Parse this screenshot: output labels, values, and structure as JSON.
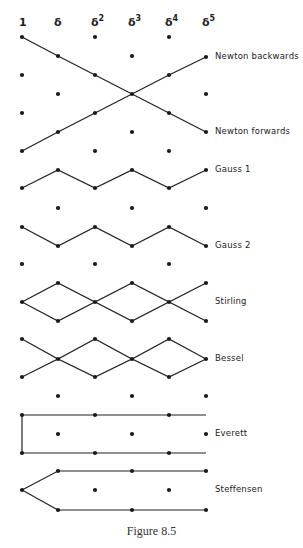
{
  "figure": {
    "caption": "Figure 8.5",
    "columns": [
      {
        "base": "1",
        "power": ""
      },
      {
        "base": "δ",
        "power": ""
      },
      {
        "base": "δ",
        "power": "2"
      },
      {
        "base": "δ",
        "power": "3"
      },
      {
        "base": "δ",
        "power": "4"
      },
      {
        "base": "δ",
        "power": "5"
      }
    ],
    "col_x": [
      22,
      58,
      95,
      132,
      169,
      206
    ],
    "line_color": "#222222",
    "dot_color": "#1a1a1a",
    "schemes": [
      {
        "name": "Newton backwards",
        "label_y": 57,
        "paths": [
          [
            [
              0,
              151
            ],
            [
              1,
              132
            ],
            [
              2,
              113
            ],
            [
              3,
              94
            ],
            [
              4,
              75
            ],
            [
              5,
              57
            ]
          ]
        ]
      },
      {
        "name": "Newton forwards",
        "label_y": 132,
        "paths": [
          [
            [
              0,
              37
            ],
            [
              1,
              56
            ],
            [
              2,
              75
            ],
            [
              3,
              94
            ],
            [
              4,
              113
            ],
            [
              5,
              132
            ]
          ]
        ]
      },
      {
        "name": "Gauss 1",
        "label_y": 170,
        "paths": [
          [
            [
              0,
              188
            ],
            [
              1,
              170
            ],
            [
              2,
              188
            ],
            [
              3,
              170
            ],
            [
              4,
              188
            ],
            [
              5,
              170
            ]
          ]
        ]
      },
      {
        "name": "Gauss 2",
        "label_y": 246,
        "paths": [
          [
            [
              0,
              227
            ],
            [
              1,
              246
            ],
            [
              2,
              227
            ],
            [
              3,
              246
            ],
            [
              4,
              227
            ],
            [
              5,
              246
            ]
          ]
        ]
      },
      {
        "name": "Stirling",
        "label_y": 302,
        "paths": [
          [
            [
              0,
              302
            ],
            [
              1,
              283
            ],
            [
              2,
              302
            ],
            [
              3,
              283
            ],
            [
              4,
              302
            ],
            [
              5,
              283
            ]
          ],
          [
            [
              0,
              302
            ],
            [
              1,
              321
            ],
            [
              2,
              302
            ],
            [
              3,
              321
            ],
            [
              4,
              302
            ],
            [
              5,
              321
            ]
          ]
        ]
      },
      {
        "name": "Bessel",
        "label_y": 359,
        "paths": [
          [
            [
              0,
              339
            ],
            [
              1,
              359
            ],
            [
              2,
              339
            ],
            [
              3,
              359
            ],
            [
              4,
              339
            ],
            [
              5,
              359
            ]
          ],
          [
            [
              0,
              377
            ],
            [
              1,
              359
            ],
            [
              2,
              377
            ],
            [
              3,
              359
            ],
            [
              4,
              377
            ],
            [
              5,
              359
            ]
          ]
        ]
      },
      {
        "name": "Everett",
        "label_y": 434,
        "paths": [
          [
            [
              0,
              415
            ],
            [
              2,
              415
            ],
            [
              4,
              415
            ],
            [
              5,
              415
            ]
          ],
          [
            [
              0,
              453
            ],
            [
              2,
              453
            ],
            [
              4,
              453
            ],
            [
              5,
              453
            ]
          ],
          [
            [
              0,
              415
            ],
            [
              0,
              453
            ]
          ]
        ],
        "line_only_endpoints": [
          [
            5,
            415
          ],
          [
            5,
            453
          ]
        ]
      },
      {
        "name": "Steffensen",
        "label_y": 490,
        "paths": [
          [
            [
              0,
              490
            ],
            [
              1,
              471
            ],
            [
              3,
              471
            ],
            [
              5,
              471
            ]
          ],
          [
            [
              0,
              490
            ],
            [
              1,
              510
            ],
            [
              3,
              510
            ],
            [
              5,
              510
            ]
          ]
        ]
      }
    ],
    "loose_dots": [
      [
        2,
        37
      ],
      [
        4,
        37
      ],
      [
        3,
        56
      ],
      [
        0,
        75
      ],
      [
        1,
        94
      ],
      [
        5,
        94
      ],
      [
        0,
        113
      ],
      [
        3,
        132
      ],
      [
        2,
        151
      ],
      [
        4,
        151
      ],
      [
        1,
        208
      ],
      [
        3,
        208
      ],
      [
        5,
        208
      ],
      [
        0,
        264
      ],
      [
        2,
        264
      ],
      [
        4,
        264
      ],
      [
        1,
        396
      ],
      [
        3,
        396
      ],
      [
        5,
        396
      ],
      [
        1,
        434
      ],
      [
        3,
        434
      ],
      [
        5,
        434
      ],
      [
        2,
        490
      ],
      [
        4,
        490
      ]
    ]
  }
}
